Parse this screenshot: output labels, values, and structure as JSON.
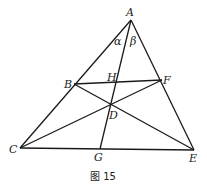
{
  "figure": {
    "caption": "图 15",
    "points": {
      "A": {
        "label": "A",
        "x": 131,
        "y": 20
      },
      "B": {
        "label": "B",
        "x": 74,
        "y": 84
      },
      "F": {
        "label": "F",
        "x": 162,
        "y": 80
      },
      "H": {
        "label": "H",
        "x": 116,
        "y": 82
      },
      "D": {
        "label": "D",
        "x": 110,
        "y": 105
      },
      "C": {
        "label": "C",
        "x": 20,
        "y": 148
      },
      "G": {
        "label": "G",
        "x": 100,
        "y": 149
      },
      "E": {
        "label": "E",
        "x": 194,
        "y": 150
      }
    },
    "angles": {
      "alpha": "α",
      "beta": "β"
    },
    "segments": [
      "AC",
      "AE",
      "CE",
      "BF",
      "BE",
      "CF",
      "AG"
    ]
  }
}
